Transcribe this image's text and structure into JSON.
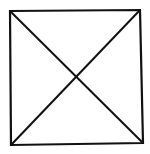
{
  "diagram": {
    "type": "square-with-diagonals",
    "stroke_color": "#111111",
    "background": "#ffffff",
    "square": {
      "top_left": [
        10,
        11
      ],
      "top_right": [
        140,
        10
      ],
      "bottom_right": [
        143,
        143
      ],
      "bottom_left": [
        11,
        145
      ]
    },
    "diagonals": [
      {
        "from": "top_left",
        "to": "bottom_right"
      },
      {
        "from": "top_right",
        "to": "bottom_left"
      }
    ]
  }
}
